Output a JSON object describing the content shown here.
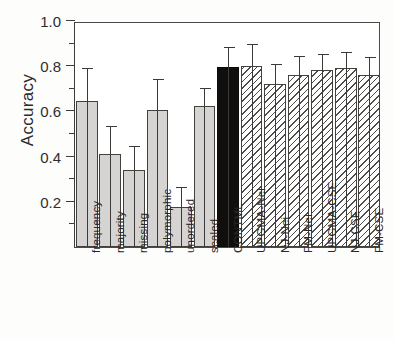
{
  "chart_data": {
    "type": "bar",
    "title": "",
    "subtitle": "",
    "xlabel": "",
    "ylabel": "Accuracy",
    "ylim": [
      0.0,
      1.0
    ],
    "ytick_labels": [
      "1.0",
      "0.8",
      "0.6",
      "0.4",
      "0.2"
    ],
    "ytick_values": [
      1.0,
      0.8,
      0.6,
      0.4,
      0.2
    ],
    "yminor_values": [
      0.9,
      0.7,
      0.5,
      0.3,
      0.1
    ],
    "grid": false,
    "legend": "none",
    "categories": [
      "frequency",
      "majority",
      "missing",
      "polymorphic",
      "unordered",
      "scaled",
      "CONTML",
      "UPGMA-Nei",
      "NJ-Nei",
      "FM-Nei",
      "UPGMA-CSE",
      "NJ-CSE",
      "FM-CSE"
    ],
    "values": [
      0.645,
      0.41,
      0.34,
      0.605,
      0.175,
      0.625,
      0.795,
      0.8,
      0.72,
      0.76,
      0.785,
      0.79,
      0.76
    ],
    "error_high": [
      0.79,
      0.535,
      0.445,
      0.745,
      0.265,
      0.705,
      0.885,
      0.9,
      0.81,
      0.845,
      0.855,
      0.865,
      0.84
    ],
    "bar_styles": [
      "solid-grey",
      "solid-grey",
      "solid-grey",
      "solid-grey",
      "solid-grey",
      "solid-grey",
      "solid-black",
      "hatched",
      "hatched",
      "hatched",
      "hatched",
      "hatched",
      "hatched"
    ],
    "colors": {
      "grey_fill": "#d5d4d2",
      "black_fill": "#100f0e",
      "hatch_line": "#4e4c4a",
      "outline": "#44403c",
      "axis": "#3d3d3d",
      "text": "#272727"
    }
  }
}
